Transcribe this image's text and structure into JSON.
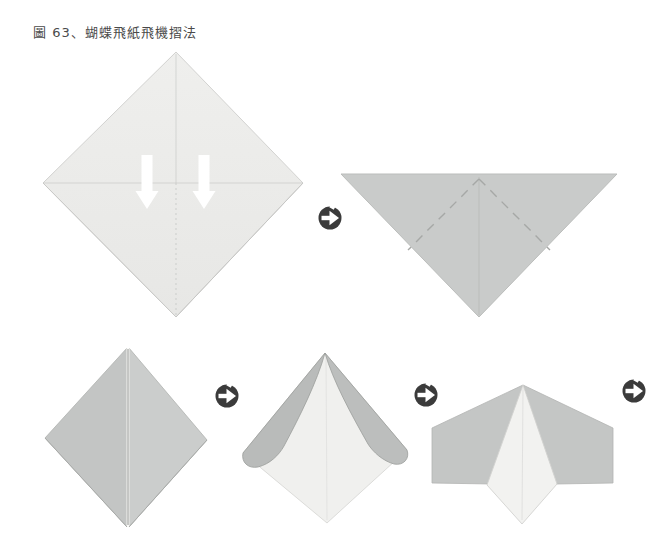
{
  "page": {
    "title": "圖 63、蝴蝶飛紙飛機摺法"
  },
  "colors": {
    "background": "#ffffff",
    "title_text": "#4a4a4a",
    "paper_step1": "#ebebe9",
    "paper_step2": "#c9cbca",
    "paper_step3_left": "#c3c5c4",
    "paper_step3_right": "#cbcdcc",
    "paper_step4_flap_left": "#b9bbba",
    "paper_step4_flap_right": "#bcbebd",
    "paper_underside": "#f0f0ee",
    "paper_step5_wing": "#c4c6c5",
    "paper_step5_body": "#f2f2f0",
    "crease_line": "#c9cbc9",
    "dashed_fold_line": "#a6a8a6",
    "split_gap": "#fbfbf9",
    "split_edge": "#909290",
    "icon_circle": "#3b3b3b",
    "fold_arrow": "#ffffff"
  },
  "icons": {
    "next_step": "circular-arrow-right",
    "fold_direction": "white-down-arrow"
  },
  "steps": [
    {
      "name": "unfolded-square-with-two-fold-arrows"
    },
    {
      "name": "triangle-with-dashed-fold-lines"
    },
    {
      "name": "kite-fold-closed"
    },
    {
      "name": "flaps-curled-open"
    },
    {
      "name": "finished-butterfly-plane"
    }
  ]
}
